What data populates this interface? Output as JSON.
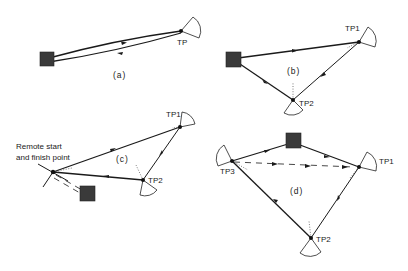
{
  "figure": {
    "panels": [
      {
        "id": "a",
        "label": "(a)",
        "route": "out-and-return",
        "turning_points": [
          {
            "name": "TP"
          }
        ],
        "start_finish": "base square"
      },
      {
        "id": "b",
        "label": "(b)",
        "route": "triangle",
        "turning_points": [
          {
            "name": "TP1"
          },
          {
            "name": "TP2"
          }
        ],
        "start_finish": "base square"
      },
      {
        "id": "c",
        "label": "(c)",
        "route": "triangle with remote start",
        "turning_points": [
          {
            "name": "TP1"
          },
          {
            "name": "TP2"
          }
        ],
        "start_finish": "remote",
        "annotation_line1": "Remote start",
        "annotation_line2": "and finish point"
      },
      {
        "id": "d",
        "label": "(d)",
        "route": "triangle with base on leg",
        "turning_points": [
          {
            "name": "TP1"
          },
          {
            "name": "TP2"
          },
          {
            "name": "TP3"
          }
        ],
        "start_finish": "base square on first leg"
      }
    ]
  },
  "colors": {
    "line": "#1a1a1a",
    "base_square": "#3a3a3a",
    "background": "#ffffff"
  }
}
